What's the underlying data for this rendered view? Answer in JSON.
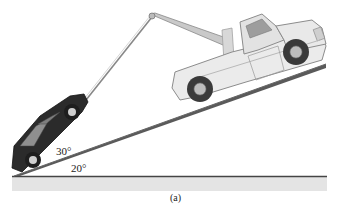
{
  "diagram": {
    "labels": {
      "cable_angle": "30°",
      "incline_angle": "20°",
      "caption": "(a)"
    },
    "objects": [
      "tow-truck",
      "car",
      "tow-cable",
      "boom",
      "incline",
      "ground"
    ],
    "colors": {
      "car": "#2a2a2a",
      "truck_body": "#e6e6e6",
      "truck_outline": "#8a8a8a",
      "incline": "#555555",
      "ground_band": "#e2e2e2",
      "cable": "#777777"
    }
  }
}
